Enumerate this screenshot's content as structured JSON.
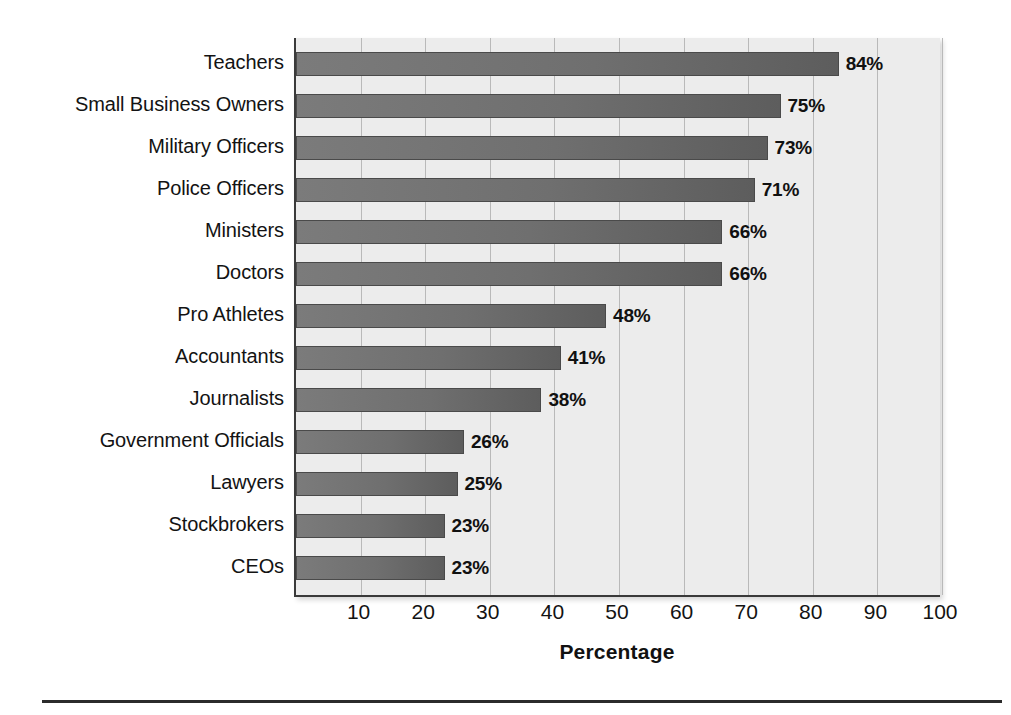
{
  "chart_data": {
    "type": "bar",
    "orientation": "horizontal",
    "title": "",
    "xlabel": "Percentage",
    "ylabel": "",
    "xlim": [
      0,
      100
    ],
    "xticks": [
      10,
      20,
      30,
      40,
      50,
      60,
      70,
      80,
      90,
      100
    ],
    "grid": true,
    "legend": null,
    "value_suffix": "%",
    "categories": [
      "Teachers",
      "Small Business Owners",
      "Military Officers",
      "Police Officers",
      "Ministers",
      "Doctors",
      "Pro Athletes",
      "Accountants",
      "Journalists",
      "Government Officials",
      "Lawyers",
      "Stockbrokers",
      "CEOs"
    ],
    "values": [
      84,
      75,
      73,
      71,
      66,
      66,
      48,
      41,
      38,
      26,
      25,
      23,
      23
    ],
    "value_labels": [
      "84%",
      "75%",
      "73%",
      "71%",
      "66%",
      "66%",
      "48%",
      "41%",
      "38%",
      "26%",
      "25%",
      "23%",
      "23%"
    ],
    "colors": {
      "bar_fill": "#6f6f6f",
      "bar_edge": "#4a4a4a",
      "plot_background": "#ececec",
      "gridline": "#b9b9b9",
      "axis": "#3a3a3a",
      "text": "#131313"
    }
  }
}
